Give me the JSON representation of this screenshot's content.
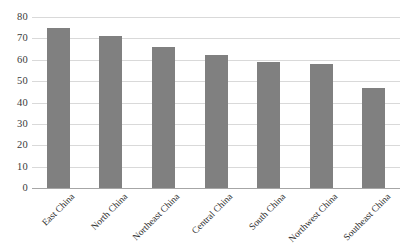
{
  "chart_data": {
    "type": "bar",
    "title": "",
    "subtitle": "",
    "xlabel": "",
    "ylabel": "",
    "categories": [
      "East China",
      "North China",
      "Northeast China",
      "Central China",
      "South China",
      "Northwest China",
      "Southeast China"
    ],
    "values": [
      75,
      71,
      66,
      62,
      59,
      58,
      47
    ],
    "ylim": [
      0,
      80
    ],
    "ytick_step": 10,
    "ytick_labels": [
      "80",
      "70",
      "60",
      "50",
      "40",
      "30",
      "20",
      "10",
      "0"
    ],
    "ytick_values": [
      80,
      70,
      60,
      50,
      40,
      30,
      20,
      10,
      0
    ],
    "grid": true,
    "grid_axis": "y",
    "legend": false,
    "legend_position": "none",
    "xtick_label_rotation": -45,
    "series": [
      {
        "name": "",
        "values": [
          75,
          71,
          66,
          62,
          59,
          58,
          47
        ]
      }
    ]
  },
  "colors": {
    "bar": "#808080",
    "gridline": "#d9d9d9",
    "axis_line": "#a6a6a6",
    "background": "#ffffff",
    "tick_text": "#3a3a3a",
    "category_text": "#2f2f2f"
  }
}
